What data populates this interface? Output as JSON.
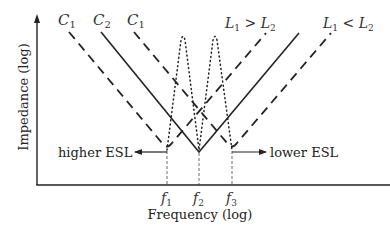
{
  "axes": {
    "x_label": "Frequency (log)",
    "y_label": "Impedance (log)"
  },
  "curve_labels": {
    "c1_left": {
      "main": "C",
      "sub": "1"
    },
    "c2": {
      "main": "C",
      "sub": "2"
    },
    "c1_right": {
      "main": "C",
      "sub": "1"
    },
    "l_greater": {
      "a": "L",
      "a_sub": "1",
      "op": " > ",
      "b": "L",
      "b_sub": "2"
    },
    "l_less": {
      "a": "L",
      "a_sub": "1",
      "op": " < ",
      "b": "L",
      "b_sub": "2"
    }
  },
  "frequency_ticks": [
    {
      "main": "f",
      "sub": "1"
    },
    {
      "main": "f",
      "sub": "2"
    },
    {
      "main": "f",
      "sub": "3"
    }
  ],
  "annotations": {
    "higher_esl": "higher ESL",
    "lower_esl": "lower ESL"
  },
  "colors": {
    "line": "#222222",
    "text": "#333333"
  }
}
